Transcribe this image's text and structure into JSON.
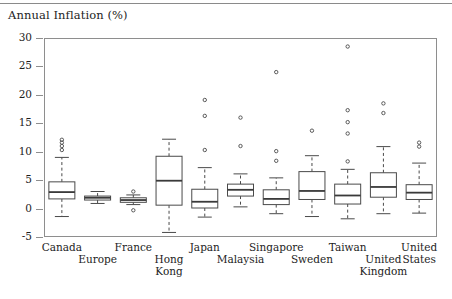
{
  "figure": {
    "title": "Annual Inflation (%)",
    "rule_above_title": true
  },
  "chart_data": {
    "type": "boxplot",
    "title": "Annual Inflation (%)",
    "xlabel": "",
    "ylabel": "Annual Inflation (%)",
    "ylim": [
      -5,
      30
    ],
    "yticks": [
      -5,
      0,
      5,
      10,
      15,
      20,
      25,
      30
    ],
    "ytick_labels": [
      "-5",
      "0",
      "5",
      "10",
      "15",
      "20",
      "25",
      "30"
    ],
    "grid": false,
    "legend": null,
    "categories": [
      "Canada",
      "Europe",
      "France",
      "Hong Kong",
      "Japan",
      "Malaysia",
      "Singapore",
      "Sweden",
      "Taiwan",
      "United Kingdom",
      "United States"
    ],
    "boxes": [
      {
        "name": "Canada",
        "whisker_low": -1.4,
        "q1": 1.7,
        "median": 2.9,
        "q3": 4.7,
        "whisker_high": 9.0,
        "outliers": [
          10.3,
          11.0,
          11.6,
          12.1
        ]
      },
      {
        "name": "Europe",
        "whisker_low": 0.9,
        "q1": 1.5,
        "median": 1.9,
        "q3": 2.2,
        "whisker_high": 3.0,
        "outliers": []
      },
      {
        "name": "France",
        "whisker_low": 0.7,
        "q1": 1.1,
        "median": 1.5,
        "q3": 1.9,
        "whisker_high": 2.4,
        "outliers": [
          3.0,
          -0.3
        ]
      },
      {
        "name": "Hong Kong",
        "whisker_low": -4.2,
        "q1": 0.6,
        "median": 4.9,
        "q3": 9.2,
        "whisker_high": 12.2,
        "outliers": []
      },
      {
        "name": "Japan",
        "whisker_low": -1.5,
        "q1": 0.1,
        "median": 1.2,
        "q3": 3.4,
        "whisker_high": 7.2,
        "outliers": [
          10.3,
          16.3,
          19.1
        ]
      },
      {
        "name": "Malaysia",
        "whisker_low": 0.3,
        "q1": 2.2,
        "median": 3.3,
        "q3": 4.3,
        "whisker_high": 6.1,
        "outliers": [
          11.0,
          16.0
        ]
      },
      {
        "name": "Singapore",
        "whisker_low": -0.9,
        "q1": 0.7,
        "median": 1.7,
        "q3": 3.3,
        "whisker_high": 5.4,
        "outliers": [
          8.4,
          10.1,
          24.0
        ]
      },
      {
        "name": "Sweden",
        "whisker_low": -1.4,
        "q1": 1.6,
        "median": 3.1,
        "q3": 6.5,
        "whisker_high": 9.3,
        "outliers": [
          13.7
        ]
      },
      {
        "name": "Taiwan",
        "whisker_low": -1.8,
        "q1": 0.8,
        "median": 2.3,
        "q3": 4.3,
        "whisker_high": 6.9,
        "outliers": [
          8.3,
          13.2,
          15.2,
          17.3,
          28.5
        ]
      },
      {
        "name": "United Kingdom",
        "whisker_low": -0.9,
        "q1": 2.0,
        "median": 3.8,
        "q3": 6.3,
        "whisker_high": 10.9,
        "outliers": [
          16.8,
          18.5
        ]
      },
      {
        "name": "United States",
        "whisker_low": -0.8,
        "q1": 1.6,
        "median": 2.8,
        "q3": 4.2,
        "whisker_high": 8.0,
        "outliers": [
          10.9,
          11.6
        ]
      }
    ]
  },
  "axis": {
    "y_labels": [
      "30",
      "25",
      "20",
      "15",
      "10",
      "5",
      "0",
      "-5"
    ],
    "x_labels": [
      {
        "text": "Canada",
        "row": 0
      },
      {
        "text": "Europe",
        "row": 1
      },
      {
        "text": "France",
        "row": 0
      },
      {
        "text": "Hong",
        "row": 1,
        "text2": "Kong"
      },
      {
        "text": "Japan",
        "row": 0
      },
      {
        "text": "Malaysia",
        "row": 1
      },
      {
        "text": "Singapore",
        "row": 0
      },
      {
        "text": "Sweden",
        "row": 1
      },
      {
        "text": "Taiwan",
        "row": 0
      },
      {
        "text": "United",
        "row": 1,
        "text2": "Kingdom"
      },
      {
        "text": "United",
        "row": 0,
        "text2": "States"
      }
    ]
  },
  "style": {
    "line_color": "#4a4a4a",
    "frame_color": "#8e8e8e",
    "median_color": "#3a3a3a",
    "background": "#ffffff"
  }
}
